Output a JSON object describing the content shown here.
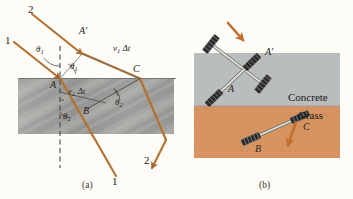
{
  "figure": {
    "panels": [
      {
        "id": "a",
        "caption": "(a)",
        "kind": "wavefront-refraction-diagram",
        "medium_band_label": "",
        "ray_labels": {
          "incident_upper": "2",
          "incident_lower": "1",
          "exit_lower_right": "2",
          "exit_bottom": "1"
        },
        "point_labels": {
          "a_surface": "A",
          "a_prime": "A′",
          "b_inside": "B",
          "c_surface": "C"
        },
        "angle_labels": {
          "theta1_normal": "θ",
          "theta1_normal_sub": "1",
          "theta1_wavefront": "θ",
          "theta1_wavefront_sub": "1",
          "theta2_normal": "θ",
          "theta2_normal_sub": "2",
          "theta2_wavefront": "θ",
          "theta2_wavefront_sub": "2"
        },
        "distance_labels": {
          "upper": "v",
          "upper_sub": "1",
          "upper_rest": " Δt",
          "lower": "v",
          "lower_sub": "2",
          "lower_rest": " Δt"
        }
      },
      {
        "id": "b",
        "caption": "(b)",
        "kind": "wheel-axle-analogy",
        "material_labels": {
          "upper": "Concrete",
          "lower": "Grass"
        },
        "point_labels": {
          "a_axle_left": "A",
          "a_prime_axle_right": "A′",
          "b_axle_left": "B",
          "c_axle_right": "C"
        },
        "direction_arrows": [
          {
            "name": "incoming-direction-arrow"
          },
          {
            "name": "outgoing-direction-arrow"
          }
        ]
      }
    ]
  },
  "colors": {
    "page_background": "#fdfcf7",
    "ray_orange": "#b5702e",
    "arrow_orange": "#c0702c",
    "medium_gray": "#9a9a98",
    "concrete_gray": "#b9bcbd",
    "grass_orange": "#d79360",
    "text_dark": "#2a2622",
    "dashed_normal": "#4a4642",
    "axle_metal": "#d8d8d4",
    "wheel_dark": "#2b2b2b"
  }
}
